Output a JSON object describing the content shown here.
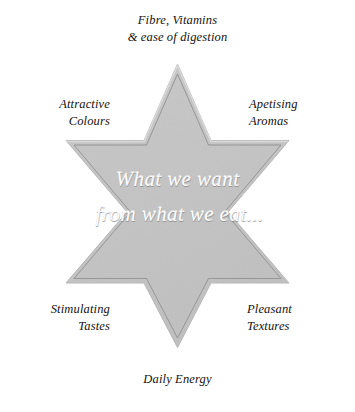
{
  "diagram": {
    "type": "six-pointed-star",
    "shape_name": "hexagram",
    "title": "What we want from what we eat",
    "colors": {
      "background": "#ffffff",
      "star_fill": "#c4c4c4",
      "star_bevel_light": "#d2d2d2",
      "star_inner_outline": "#8d8d8d",
      "star_edge": "#b0b0b0",
      "label_text": "#15120f",
      "center_text": "#fbfbfb"
    },
    "center_text": {
      "line1": "What we want",
      "line2": "from what we eat..."
    },
    "points": [
      {
        "id": "top",
        "position": "top",
        "line1": "Fibre, Vitamins",
        "line2": "& ease of digestion"
      },
      {
        "id": "upper-right",
        "position": "upper-right",
        "line1": "Apetising",
        "line2": "Aromas"
      },
      {
        "id": "lower-right",
        "position": "lower-right",
        "line1": "Pleasant",
        "line2": "Textures"
      },
      {
        "id": "bottom",
        "position": "bottom",
        "line1": "Daily Energy",
        "line2": ""
      },
      {
        "id": "lower-left",
        "position": "lower-left",
        "line1": "Stimulating",
        "line2": "Tastes"
      },
      {
        "id": "upper-left",
        "position": "upper-left",
        "line1": "Attractive",
        "line2": "Colours"
      }
    ]
  }
}
